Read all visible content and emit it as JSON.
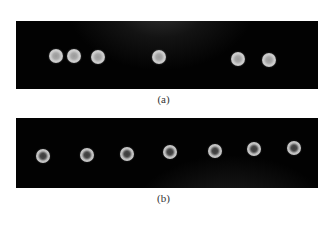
{
  "figure": {
    "panels": [
      {
        "id": "a",
        "caption": "(a)",
        "dot_count": 6,
        "dot_style": "solid-light",
        "background_color": "#020202",
        "dot_color": "#c8c8c8"
      },
      {
        "id": "b",
        "caption": "(b)",
        "dot_count": 7,
        "dot_style": "ring-with-dark-center",
        "background_color": "#020202",
        "dot_color": "#c4c4c4",
        "dot_center_color": "#444444"
      }
    ]
  }
}
